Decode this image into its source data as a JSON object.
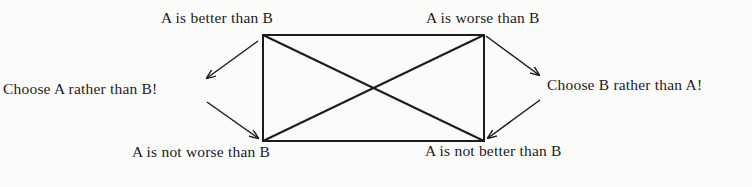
{
  "diagram": {
    "corners": {
      "top_left": "A is better than B",
      "top_right": "A is worse than B",
      "bottom_left": "A is not worse than B",
      "bottom_right": "A is not better than B"
    },
    "outcomes": {
      "left": "Choose A rather than B!",
      "right": "Choose B rather than A!"
    },
    "colors": {
      "line": "#1c1c1c",
      "background": "#fbfbfa"
    }
  }
}
